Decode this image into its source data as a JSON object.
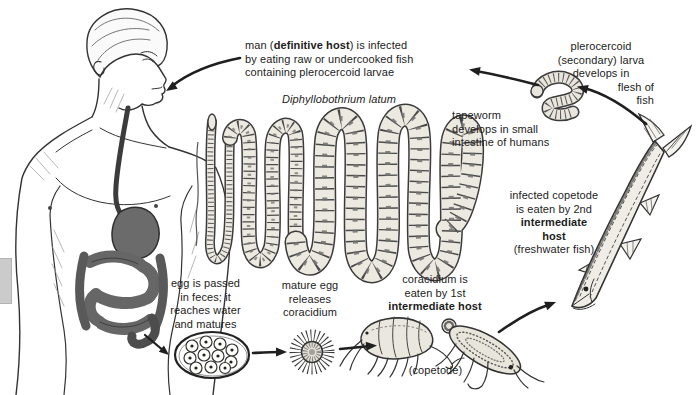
{
  "colors": {
    "ink": "#1f1f1f",
    "worm_fill": "#ece9e0",
    "gi_dark": "#6b6b6b",
    "side_tab_gray": "#cbcbcb"
  },
  "species_label": "Diphyllobothrium latum",
  "labels": {
    "man_infection": {
      "line1_pre": "man (",
      "line1_bold": "definitive host",
      "line1_post": ") is infected",
      "line2": "by eating raw or undercooked fish",
      "line3": "containing plerocercoid larvae"
    },
    "plerocercoid": {
      "line1": "plerocercoid",
      "line2": "(secondary) larva",
      "line3": "develops in",
      "line4": "flesh of",
      "line5": "fish"
    },
    "tapeworm": {
      "line1": "tapeworm",
      "line2": "develops in small",
      "line3": "intestine of humans"
    },
    "infected_copepod": {
      "line1": "infected copetode",
      "line2": "is eaten by 2nd",
      "line3_bold": "intermediate",
      "line4_bold": "host",
      "line5": "(freshwater fish)"
    },
    "egg": {
      "line1": "egg is passed",
      "line2": "in feces; it",
      "line3": "reaches water",
      "line4": "and matures"
    },
    "mature_egg": {
      "line1": "mature egg",
      "line2": "releases",
      "line3": "coracidium"
    },
    "coracidium": {
      "line1": "coracidium is",
      "line2": "eaten by 1st",
      "line3_bold": "intermediate host"
    },
    "copepod_caption": "(copetode)"
  },
  "figures": [
    "human-figure",
    "digestive-tract",
    "tapeworm-figure",
    "plerocercoid-larva-figure",
    "fish-figure",
    "egg-mass-figure",
    "coracidium-figure",
    "copepod-figure",
    "infected-copepod-figure"
  ]
}
